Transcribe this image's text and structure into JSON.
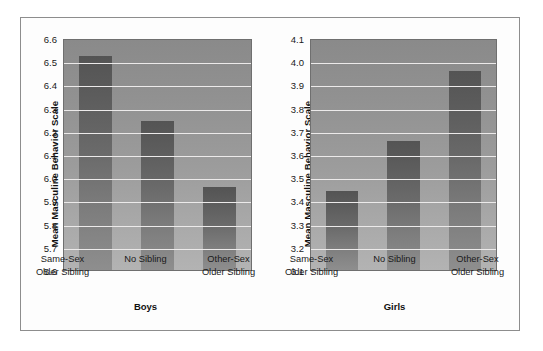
{
  "chart_data": [
    {
      "type": "bar",
      "title": "Boys",
      "xlabel": "Boys",
      "ylabel": "Mean Masculine Behavior Scale",
      "categories": [
        "Same-Sex Older Sibling",
        "No Sibling",
        "Other-Sex Older Sibling"
      ],
      "category_lines": [
        [
          "Same-Sex",
          "Older Sibling"
        ],
        [
          "No Sibling",
          ""
        ],
        [
          "Other-Sex",
          "Older Sibling"
        ]
      ],
      "values": [
        6.53,
        6.25,
        5.96
      ],
      "ylim": [
        5.6,
        6.6
      ],
      "ytick_step": 0.1,
      "yticks": [
        "6.6",
        "6.5",
        "6.4",
        "6.3",
        "6.2",
        "6.1",
        "6.0",
        "5.9",
        "5.8",
        "5.7",
        "5.6"
      ],
      "grid": true,
      "legend": "none"
    },
    {
      "type": "bar",
      "title": "Girls",
      "xlabel": "Girls",
      "ylabel": "Mean Masculine Behavior Scale",
      "categories": [
        "Same-Sex Older Sibling",
        "No Sibling",
        "Other-Sex Older Sibling"
      ],
      "category_lines": [
        [
          "Same-Sex",
          "Older Sibling"
        ],
        [
          "No Sibling",
          ""
        ],
        [
          "Other-Sex",
          "Older Sibling"
        ]
      ],
      "values": [
        3.445,
        3.66,
        3.965
      ],
      "ylim": [
        3.1,
        4.1
      ],
      "ytick_step": 0.1,
      "yticks": [
        "4.1",
        "4.0",
        "3.9",
        "3.8",
        "3.7",
        "3.6",
        "3.5",
        "3.4",
        "3.3",
        "3.2",
        "3.1"
      ],
      "grid": true,
      "legend": "none"
    }
  ],
  "colors": {
    "bar_top": "#545454",
    "bar_bottom": "#8e8e8e",
    "plot_bg_top": "#8a8a8a",
    "plot_bg_bottom": "#b3b3b3",
    "gridline": "#eceaea",
    "frame_border": "#8d8d8d",
    "axis_border": "#6f6f6f",
    "text": "#1a1a1a",
    "page_bg": "#ffffff"
  },
  "panels": [
    {
      "id": "boys",
      "ylabel": "Mean Masculine Behavior Scale",
      "title": "Boys"
    },
    {
      "id": "girls",
      "ylabel": "Mean Masculine Behavior Scale",
      "title": "Girls"
    }
  ]
}
